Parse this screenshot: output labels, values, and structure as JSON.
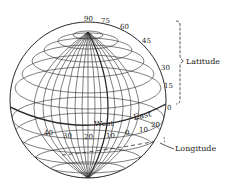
{
  "diagram": {
    "latitude": {
      "label": "Latitude",
      "ticks": [
        "90",
        "75",
        "60",
        "45",
        "30",
        "15",
        "0"
      ]
    },
    "longitude": {
      "label": "Longitude",
      "west_label": "West",
      "east_label": "East",
      "ticks_west": [
        "40",
        "30",
        "20",
        "10"
      ],
      "tick_zero": "0",
      "ticks_east": [
        "10",
        "20"
      ]
    },
    "colors": {
      "line": "#2a2a2a",
      "background": "#ffffff"
    }
  }
}
